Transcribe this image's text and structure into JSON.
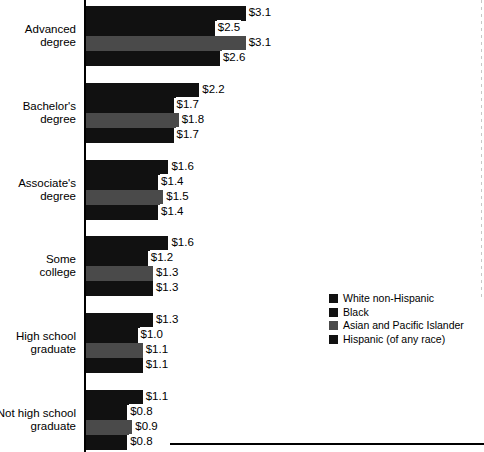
{
  "chart_data": {
    "type": "bar",
    "orientation": "horizontal",
    "title": "",
    "subtitle": "",
    "xlabel": "",
    "ylabel": "",
    "grid": false,
    "legend_position": "right-middle",
    "value_prefix": "$",
    "xlim": [
      0,
      3.4
    ],
    "categories": [
      "Advanced\ndegree",
      "Bachelor's\ndegree",
      "Associate's\ndegree",
      "Some\ncollege",
      "High school\ngraduate",
      "Not high school\ngraduate"
    ],
    "series": [
      {
        "name": "White non-Hispanic",
        "color": "#111111",
        "values": [
          3.1,
          2.2,
          1.6,
          1.6,
          1.3,
          1.1
        ],
        "labels": [
          "$3.1",
          "$2.2",
          "$1.6",
          "$1.6",
          "$1.3",
          "$1.1"
        ]
      },
      {
        "name": "Black",
        "color": "#111111",
        "values": [
          2.5,
          1.7,
          1.4,
          1.2,
          1.0,
          0.8
        ],
        "labels": [
          "$2.5",
          "$1.7",
          "$1.4",
          "$1.2",
          "$1.0",
          "$0.8"
        ]
      },
      {
        "name": "Asian and Pacific Islander",
        "color": "#4a4a4a",
        "values": [
          3.1,
          1.8,
          1.5,
          1.3,
          1.1,
          0.9
        ],
        "labels": [
          "$3.1",
          "$1.8",
          "$1.5",
          "$1.3",
          "$1.1",
          "$0.9"
        ]
      },
      {
        "name": "Hispanic (of any race)",
        "color": "#111111",
        "values": [
          2.6,
          1.7,
          1.4,
          1.3,
          1.1,
          0.8
        ],
        "labels": [
          "$2.6",
          "$1.7",
          "$1.4",
          "$1.3",
          "$1.1",
          "$0.8"
        ]
      }
    ]
  },
  "legend": {
    "entries": [
      {
        "label": "White non-Hispanic"
      },
      {
        "label": "Black"
      },
      {
        "label": "Asian and Pacific Islander"
      },
      {
        "label": "Hispanic (of any race)"
      }
    ]
  }
}
